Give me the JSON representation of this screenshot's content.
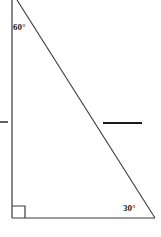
{
  "figure": {
    "type": "right-triangle-geometry-diagram",
    "background_color": "#ffffff",
    "stroke_color": "#333333",
    "labels": {
      "top_angle": "60°",
      "bottom_right_angle": "30°",
      "right_angle_marker": "90°"
    },
    "geometry": {
      "vertical_leg": {
        "x1": 12,
        "y1": 0,
        "x2": 12,
        "y2": 218
      },
      "horizontal_leg": {
        "x1": 12,
        "y1": 218,
        "x2": 155,
        "y2": 218
      },
      "hypotenuse": {
        "x1": 17,
        "y1": 0,
        "x2": 155,
        "y2": 218
      },
      "right_angle_square": {
        "x": 12,
        "y": 206,
        "size": 13
      },
      "left_tick_mark": {
        "x1": 0,
        "y1": 122,
        "x2": 8,
        "y2": 122
      },
      "answer_blank_segment": {
        "x1": 103,
        "y1": 123,
        "x2": 142,
        "y2": 123
      }
    }
  }
}
